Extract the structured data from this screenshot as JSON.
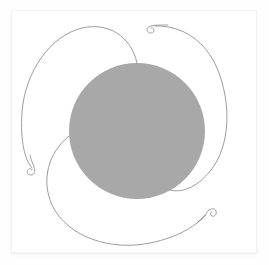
{
  "artwork": {
    "title": "Three-Armed Spiral Petal Figure",
    "background_color": "#fefefe",
    "canvas": {
      "fill": "#ffffff",
      "border_color": "#f2f2f2",
      "x": 11,
      "y": 10,
      "width": 246,
      "height": 243
    },
    "disc": {
      "name": "central-disc",
      "fill_color": "#a8a8a8",
      "center_x": 137,
      "center_y": 131,
      "radius": 68
    },
    "stroke_color": "#8a8a8a",
    "stroke_width": 0.85,
    "symmetry": "3-fold rotational",
    "arms": [
      {
        "name": "arm-upper-left",
        "path": "M 137 63 C 131 36 108 22 82 28 C 50 36 25 72 22 112 C 20 142 25 160 32 168",
        "spiral_end_x": 33,
        "spiral_end_y": 170,
        "spiral_turns": 1.35,
        "spiral_radius": 4.6,
        "spiral_rotation": 118
      },
      {
        "name": "arm-right",
        "path": "M 155 26 C 183 25 206 42 217 68 C 232 104 230 146 211 170 C 196 189 180 193 170 190",
        "spiral_end_x": 155,
        "spiral_end_y": 26,
        "spiral_turns": 1.35,
        "spiral_radius": 4.6,
        "spiral_rotation": -2
      },
      {
        "name": "arm-lower",
        "path": "M 69 136 C 48 153 41 180 52 205 C 68 238 112 251 150 243 C 180 237 198 224 206 215",
        "spiral_end_x": 208,
        "spiral_end_y": 213,
        "spiral_turns": 1.35,
        "spiral_radius": 4.6,
        "spiral_rotation": 238
      }
    ],
    "spirals": [
      {
        "name": "spiral-terminus-top",
        "path": "M 168 25 C 160 25 154 25 151 26 C 147 27 146 30 148 32 C 150 34 154 33 154 30 C 154 28 152 27 151 28"
      },
      {
        "name": "spiral-terminus-lower-left",
        "path": "M 30 155 C 31 160 33 164 34 167 C 36 171 34 175 31 175 C 28 175 26 172 28 170 C 29 168 32 168 32 170"
      },
      {
        "name": "spiral-terminus-lower-right",
        "path": "M 198 222 C 202 218 206 214 208 211 C 211 208 215 208 216 211 C 217 214 215 217 212 216 C 210 215 210 212 212 212"
      }
    ]
  }
}
